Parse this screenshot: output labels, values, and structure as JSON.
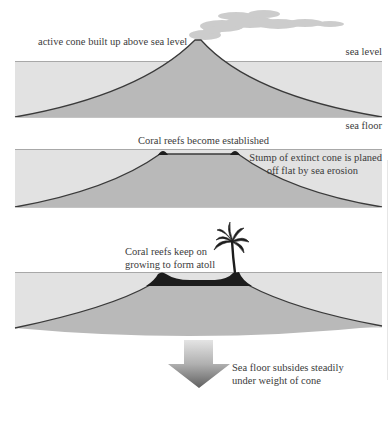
{
  "colors": {
    "sea": "#e2e2e2",
    "cone": "#b9b9b9",
    "outline": "#3a3a3a",
    "reef": "#1c1c1c",
    "smoke": "#c8c8c8",
    "arrow_top": "#e0e0e0",
    "arrow_bottom": "#6e6e6e"
  },
  "panels": [
    {
      "id": "stage-1",
      "labels": {
        "cone": "active cone built up above sea level",
        "sea_level": "sea level",
        "sea_floor": "sea floor"
      }
    },
    {
      "id": "stage-2",
      "labels": {
        "reefs": "Coral reefs become established",
        "stump_line1": "Stump of extinct cone is planed",
        "stump_line2": "off flat by sea erosion"
      }
    },
    {
      "id": "stage-3",
      "labels": {
        "atoll_line1": "Coral reefs keep on",
        "atoll_line2": "growing to form atoll",
        "subside_line1": "Sea floor subsides steadily",
        "subside_line2": "under weight of cone"
      }
    }
  ],
  "icons": [
    "smoke-plume-icon",
    "palm-tree-icon",
    "down-arrow-icon"
  ]
}
